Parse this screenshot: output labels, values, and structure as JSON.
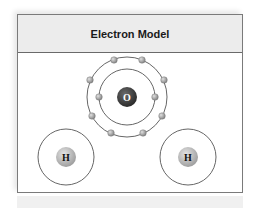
{
  "panel": {
    "title": "Electron Model"
  },
  "diagram": {
    "molecule": "H2O",
    "nuclei": [
      {
        "label": "O",
        "color": "#3c3c3c",
        "text_color": "#ffffff"
      },
      {
        "label": "H",
        "color": "#b5b5b5",
        "text_color": "#111111"
      },
      {
        "label": "H",
        "color": "#b5b5b5",
        "text_color": "#111111"
      }
    ],
    "shells": {
      "oxygen_inner_shell_electrons": 2,
      "oxygen_outer_shell_electrons": 8,
      "hydrogen_shells": 2
    },
    "colors": {
      "orbit": "#555555",
      "electron": "#9a9a9a",
      "header_bg": "#ececec",
      "border": "#7a7a7a"
    }
  }
}
